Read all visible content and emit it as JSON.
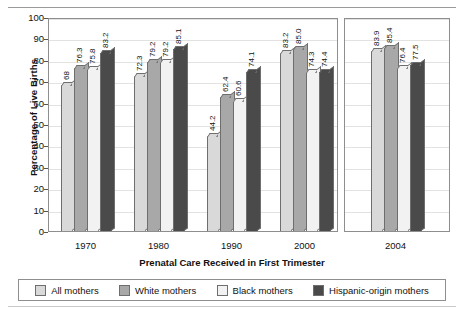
{
  "chart_data": {
    "type": "bar",
    "title": "",
    "subtitle": "",
    "xlabel": "Prenatal Care Received in First Trimester",
    "ylabel": "Percentage of Live Births",
    "categories": [
      "1970",
      "1980",
      "1990",
      "2000",
      "2004"
    ],
    "ylim": [
      0,
      100
    ],
    "yticks": [
      0,
      10,
      20,
      30,
      40,
      50,
      60,
      70,
      80,
      90,
      100
    ],
    "grid": true,
    "legend_position": "bottom",
    "axis_break_after_category": "2000",
    "series": [
      {
        "name": "All mothers",
        "color": "#d9d9d9",
        "values": [
          68,
          72.3,
          44.2,
          83.2,
          83.9
        ],
        "labels": [
          "68",
          "72.3",
          "44.2",
          "83.2",
          "83.9"
        ]
      },
      {
        "name": "White mothers",
        "color": "#a8a8a8",
        "values": [
          76.3,
          79.2,
          62.4,
          85.0,
          85.4
        ],
        "labels": [
          "76.3",
          "79.2",
          "62.4",
          "85.0",
          "85.4"
        ]
      },
      {
        "name": "Black mothers",
        "color": "#f2f2f2",
        "values": [
          75.8,
          79.2,
          60.6,
          74.3,
          76.4
        ],
        "labels": [
          "75.8",
          "79.2",
          "60.6",
          "74.3",
          "76.4"
        ]
      },
      {
        "name": "Hispanic-origin mothers",
        "color": "#4a4a4a",
        "values": [
          83.2,
          85.1,
          74.1,
          74.4,
          77.5
        ],
        "labels": [
          "83.2",
          "85.1",
          "74.1",
          "74.4",
          "77.5"
        ]
      }
    ]
  },
  "legend": {
    "items": [
      {
        "label": "All mothers",
        "color": "#d9d9d9"
      },
      {
        "label": "White mothers",
        "color": "#a8a8a8"
      },
      {
        "label": "Black mothers",
        "color": "#f2f2f2"
      },
      {
        "label": "Hispanic-origin mothers",
        "color": "#4a4a4a"
      }
    ]
  }
}
